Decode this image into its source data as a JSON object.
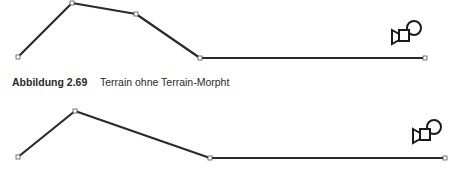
{
  "caption": {
    "label": "Abbildung 2.69",
    "text": "Terrain ohne Terrain-Morpht"
  },
  "figures": [
    {
      "name": "terrain-profile-top",
      "points": [
        [
          18,
          57
        ],
        [
          72,
          3
        ],
        [
          136,
          14
        ],
        [
          200,
          58
        ],
        [
          425,
          58
        ]
      ],
      "camera_icon": "camera-icon"
    },
    {
      "name": "terrain-profile-bottom",
      "points": [
        [
          18,
          57
        ],
        [
          75,
          11
        ],
        [
          210,
          58
        ],
        [
          445,
          58
        ]
      ],
      "camera_icon": "camera-icon"
    }
  ],
  "colors": {
    "line": "#2b2b2b",
    "vertex": "#555555"
  }
}
